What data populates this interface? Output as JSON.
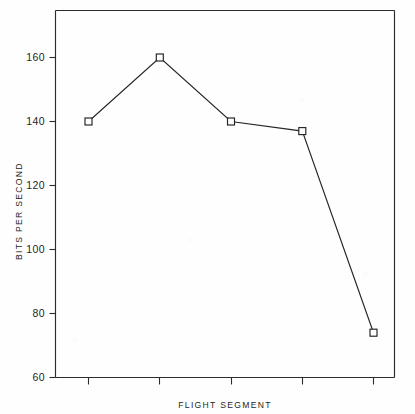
{
  "chart_data": {
    "type": "line",
    "title": "",
    "xlabel": "FLIGHT SEGMENT",
    "ylabel": "BITS PER SECOND",
    "categories": [
      "1",
      "2",
      "3",
      "4",
      "5"
    ],
    "values": [
      140,
      160,
      140,
      137,
      74
    ],
    "series": [
      {
        "name": "BITS PER SECOND",
        "values": [
          140,
          160,
          140,
          137,
          74
        ]
      }
    ],
    "ylim": [
      60,
      172
    ],
    "xlim": [
      0,
      6
    ],
    "ytick_labels": [
      "60",
      "80",
      "100",
      "120",
      "140",
      "160"
    ],
    "ytick_values": [
      60,
      80,
      100,
      120,
      140,
      160
    ],
    "xtick_labels": [
      "",
      "",
      "",
      "",
      ""
    ],
    "grid": false,
    "legend": false,
    "legend_position": "none",
    "marker": "open-square",
    "line_color": "#262626",
    "marker_face_color": "#ffffff",
    "marker_edge_color": "#222222",
    "axis_color": "#2b2b2b",
    "background_color": "#fefefe"
  },
  "axes": {
    "y_title": "BITS PER SECOND",
    "x_title": "FLIGHT SEGMENT",
    "y_ticks": [
      {
        "label": "160",
        "value": 160
      },
      {
        "label": "140",
        "value": 140
      },
      {
        "label": "120",
        "value": 120
      },
      {
        "label": "100",
        "value": 100
      },
      {
        "label": "80",
        "value": 80
      },
      {
        "label": "60",
        "value": 60
      }
    ]
  }
}
